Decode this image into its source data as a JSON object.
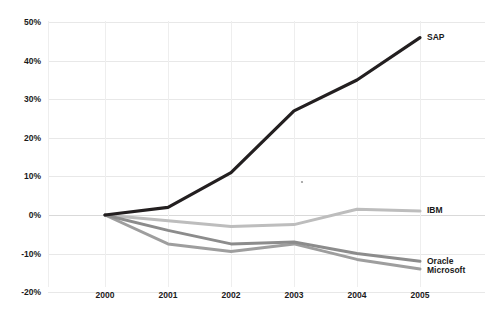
{
  "chart_data": {
    "type": "line",
    "title": "",
    "subtitle": "",
    "xlabel": "",
    "ylabel": "",
    "categories": [
      "2000",
      "2001",
      "2002",
      "2003",
      "2004",
      "2005"
    ],
    "x_tick_labels": [
      "2000",
      "2001",
      "2002",
      "2003",
      "2004",
      "2005"
    ],
    "y_tick_labels": [
      "50%",
      "40%",
      "30%",
      "20%",
      "10%",
      "0%",
      "-10%",
      "-20%"
    ],
    "y_tick_values": [
      50,
      40,
      30,
      20,
      10,
      0,
      -10,
      -20
    ],
    "ylim": [
      -20,
      50
    ],
    "grid": true,
    "legend_position": "end-of-line labels",
    "series": [
      {
        "name": "SAP",
        "label": "SAP",
        "color": "#231f20",
        "width": 3.2,
        "values": [
          0,
          2,
          11,
          27,
          35,
          46
        ]
      },
      {
        "name": "IBM",
        "label": "IBM",
        "color": "#bdbdbd",
        "width": 3.0,
        "values": [
          0,
          -1.5,
          -3,
          -2.5,
          1.5,
          1
        ]
      },
      {
        "name": "Oracle",
        "label": "Oracle",
        "color": "#8c8c8c",
        "width": 3.0,
        "values": [
          0,
          -4,
          -7.5,
          -7,
          -10,
          -12
        ]
      },
      {
        "name": "Microsoft",
        "label": "Microsoft",
        "color": "#9e9e9e",
        "width": 3.0,
        "values": [
          0,
          -7.5,
          -9.5,
          -7.5,
          -11.5,
          -14
        ]
      }
    ]
  },
  "axes": {
    "y_labels": [
      "50%",
      "40%",
      "30%",
      "20%",
      "10%",
      "0%",
      "-10%",
      "-20%"
    ],
    "x_labels": [
      "2000",
      "2001",
      "2002",
      "2003",
      "2004",
      "2005"
    ]
  },
  "series_labels": {
    "sap": "SAP",
    "ibm": "IBM",
    "oracle": "Oracle",
    "microsoft": "Microsoft"
  },
  "colors": {
    "sap": "#231f20",
    "ibm": "#bdbdbd",
    "oracle": "#8c8c8c",
    "microsoft": "#9e9e9e",
    "grid": "#e8e8e8",
    "background": "#ffffff",
    "text": "#1a1a1a"
  }
}
